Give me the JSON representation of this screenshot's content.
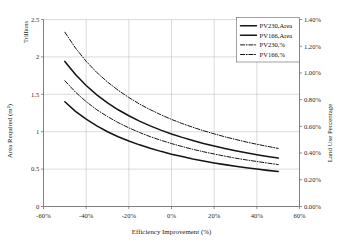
{
  "chart_data": {
    "type": "line",
    "title": "",
    "xlabel": "Efficiency Improvement (%)",
    "ylabel": "Area Required (m²)",
    "y2label": "Land Use Percentage",
    "y_unit_note": "Trillions",
    "xlim": [
      -60,
      60
    ],
    "ylim": [
      0,
      2.5
    ],
    "y2lim": [
      0,
      1.4
    ],
    "grid": true,
    "legend_position": "top-right",
    "x_ticks": [
      "-60%",
      "-40%",
      "-20%",
      "0%",
      "20%",
      "40%",
      "60%"
    ],
    "x_tick_values": [
      -60,
      -40,
      -20,
      0,
      20,
      40,
      60
    ],
    "y_ticks": [
      "0",
      "0.5",
      "1",
      "1.5",
      "2",
      "2.5"
    ],
    "y_tick_values": [
      0,
      0.5,
      1,
      1.5,
      2,
      2.5
    ],
    "y2_ticks": [
      "0.00%",
      "0.20%",
      "0.40%",
      "0.60%",
      "0.80%",
      "1.00%",
      "1.20%",
      "1.40%"
    ],
    "y2_tick_values": [
      0.0,
      0.2,
      0.4,
      0.6,
      0.8,
      1.0,
      1.2,
      1.4
    ],
    "x": [
      -50,
      -45,
      -40,
      -35,
      -30,
      -25,
      -20,
      -15,
      -10,
      -5,
      0,
      5,
      10,
      15,
      20,
      25,
      30,
      35,
      40,
      45,
      50
    ],
    "series": [
      {
        "name": "PV230,Area",
        "style": "solid",
        "axis": "left",
        "color": "#151515",
        "values": [
          1.94,
          1.764,
          1.617,
          1.492,
          1.386,
          1.293,
          1.213,
          1.141,
          1.078,
          1.021,
          0.97,
          0.924,
          0.882,
          0.843,
          0.808,
          0.776,
          0.746,
          0.719,
          0.693,
          0.669,
          0.647
        ]
      },
      {
        "name": "PV166,Area",
        "style": "solid",
        "axis": "left",
        "color": "#151515",
        "values": [
          1.4,
          1.273,
          1.167,
          1.077,
          1.0,
          0.933,
          0.875,
          0.824,
          0.778,
          0.737,
          0.7,
          0.667,
          0.636,
          0.609,
          0.583,
          0.56,
          0.538,
          0.519,
          0.5,
          0.483,
          0.467
        ]
      },
      {
        "name": "PV230,%",
        "style": "dashdot",
        "axis": "right",
        "color": "#151515",
        "values": [
          1.305,
          1.186,
          1.087,
          1.003,
          0.932,
          0.87,
          0.816,
          0.767,
          0.725,
          0.687,
          0.652,
          0.621,
          0.593,
          0.567,
          0.544,
          0.522,
          0.502,
          0.483,
          0.466,
          0.45,
          0.435
        ]
      },
      {
        "name": "PV166,%",
        "style": "dashdot",
        "axis": "right",
        "color": "#151515",
        "values": [
          0.942,
          0.856,
          0.785,
          0.724,
          0.673,
          0.628,
          0.589,
          0.554,
          0.523,
          0.496,
          0.471,
          0.449,
          0.428,
          0.41,
          0.393,
          0.377,
          0.362,
          0.349,
          0.337,
          0.325,
          0.314
        ]
      }
    ]
  },
  "legend": {
    "items": [
      {
        "label": "PV230,Area",
        "style": "solid"
      },
      {
        "label": "PV166,Area",
        "style": "solid"
      },
      {
        "label": "PV230,%",
        "style": "dashdot"
      },
      {
        "label": "PV166,%",
        "style": "dashdot"
      }
    ]
  }
}
